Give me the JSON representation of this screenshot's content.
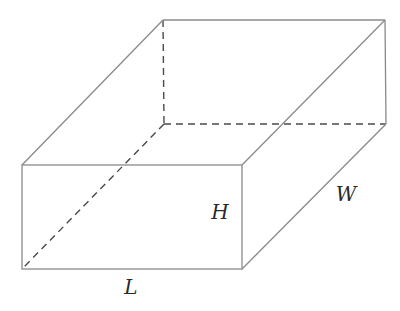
{
  "diagram": {
    "shape": "rectangular-prism",
    "colors": {
      "background": "#ffffff",
      "visible_edge": "#8a8a8a",
      "hidden_edge": "#4a4a4a",
      "label": "#2a2a2a"
    },
    "vertices": {
      "front_top_left": [
        22,
        165
      ],
      "front_top_right": [
        242,
        165
      ],
      "front_bottom_left": [
        22,
        269
      ],
      "front_bottom_right": [
        242,
        269
      ],
      "back_top_left": [
        163,
        20
      ],
      "back_top_right": [
        385,
        20
      ],
      "back_bottom_left": [
        164,
        124
      ],
      "back_bottom_right": [
        386,
        124
      ]
    },
    "hidden_edges": [
      "back_top_left-back_bottom_left",
      "back_bottom_left-back_bottom_right",
      "back_bottom_left-front_bottom_left"
    ],
    "labels": {
      "length": {
        "text": "L",
        "x": 131,
        "y": 287
      },
      "height": {
        "text": "H",
        "x": 220,
        "y": 212
      },
      "width": {
        "text": "W",
        "x": 346,
        "y": 194
      }
    }
  }
}
